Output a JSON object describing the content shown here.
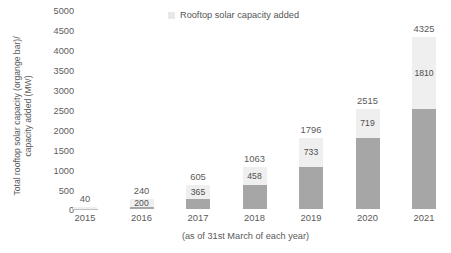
{
  "chart_data": {
    "type": "bar",
    "subtype": "stacked-bar",
    "title": "",
    "xlabel": "(as of 31st March of each year)",
    "ylabel": "Total rooftop solar capacity (organge bar)/\ncapacity added (MW)",
    "categories": [
      "2015",
      "2016",
      "2017",
      "2018",
      "2019",
      "2020",
      "2021"
    ],
    "ylim": [
      0,
      5000
    ],
    "y_ticks": [
      0,
      500,
      1000,
      1500,
      2000,
      2500,
      3000,
      3500,
      4000,
      4500,
      5000
    ],
    "grid": false,
    "legend": {
      "position": "top-center",
      "entries": [
        {
          "label": "Rooftop solar capacity added",
          "color": "#efefef"
        }
      ]
    },
    "series": [
      {
        "name": "Cumulative rooftop solar capacity",
        "role": "base",
        "color": "#a6a6a6",
        "values": [
          0,
          40,
          240,
          605,
          1063,
          1796,
          2515
        ]
      },
      {
        "name": "Rooftop solar capacity added",
        "role": "added",
        "color": "#efefef",
        "values": [
          40,
          200,
          365,
          458,
          733,
          719,
          1810
        ]
      }
    ],
    "totals": [
      40,
      240,
      605,
      1063,
      1796,
      2515,
      4325
    ],
    "bars": [
      {
        "category": "2015",
        "total": 40,
        "total_label": "40",
        "added": 40,
        "added_label": "",
        "base": 0,
        "show_added_label": false
      },
      {
        "category": "2016",
        "total": 240,
        "total_label": "240",
        "added": 200,
        "added_label": "200",
        "base": 40,
        "show_added_label": true
      },
      {
        "category": "2017",
        "total": 605,
        "total_label": "605",
        "added": 365,
        "added_label": "365",
        "base": 240,
        "show_added_label": true
      },
      {
        "category": "2018",
        "total": 1063,
        "total_label": "1063",
        "added": 458,
        "added_label": "458",
        "base": 605,
        "show_added_label": true
      },
      {
        "category": "2019",
        "total": 1796,
        "total_label": "1796",
        "added": 733,
        "added_label": "733",
        "base": 1063,
        "show_added_label": true
      },
      {
        "category": "2020",
        "total": 2515,
        "total_label": "2515",
        "added": 719,
        "added_label": "719",
        "base": 1796,
        "show_added_label": true
      },
      {
        "category": "2021",
        "total": 4325,
        "total_label": "4325",
        "added": 1810,
        "added_label": "1810",
        "base": 2515,
        "show_added_label": true
      }
    ],
    "colors": {
      "base_bar": "#a6a6a6",
      "added_bar": "#efefef",
      "text": "#5a5a5a",
      "axis_line": "#bfbfbf",
      "background": "#ffffff"
    }
  },
  "axis": {
    "y_tick_labels": [
      "5000",
      "4500",
      "4000",
      "3500",
      "3000",
      "2500",
      "2000",
      "1500",
      "1000",
      "500",
      "0"
    ],
    "y_title": "Total rooftop solar capacity (organge bar)/\ncapacity added (MW)",
    "x_tick_labels": [
      "2015",
      "2016",
      "2017",
      "2018",
      "2019",
      "2020",
      "2021"
    ],
    "x_caption": "(as of 31st March of each year)"
  },
  "legend": {
    "label": "Rooftop solar capacity added"
  }
}
